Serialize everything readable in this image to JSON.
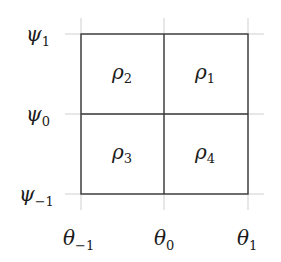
{
  "diagram": {
    "type": "partition-grid",
    "colors": {
      "line": "#3a3a3a",
      "tick": "#c8c8c8",
      "text": "#1a1a1a"
    },
    "y_axis_labels": [
      {
        "symbol": "ψ",
        "sub": "1"
      },
      {
        "symbol": "ψ",
        "sub": "0"
      },
      {
        "symbol": "ψ",
        "sub": "−1"
      }
    ],
    "x_axis_labels": [
      {
        "symbol": "θ",
        "sub": "−1"
      },
      {
        "symbol": "θ",
        "sub": "0"
      },
      {
        "symbol": "θ",
        "sub": "1"
      }
    ],
    "cells": [
      {
        "position": "top-left",
        "symbol": "ρ",
        "sub": "2"
      },
      {
        "position": "top-right",
        "symbol": "ρ",
        "sub": "1"
      },
      {
        "position": "bottom-left",
        "symbol": "ρ",
        "sub": "3"
      },
      {
        "position": "bottom-right",
        "symbol": "ρ",
        "sub": "4"
      }
    ]
  }
}
